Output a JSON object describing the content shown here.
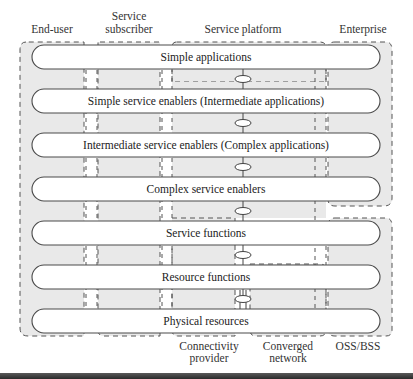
{
  "diagram": {
    "columns": [
      {
        "id": "end-user",
        "label_lines": [
          "End-user"
        ]
      },
      {
        "id": "service-subscriber",
        "label_lines": [
          "Service",
          "subscriber"
        ]
      },
      {
        "id": "service-platform",
        "label_lines": [
          "Service platform"
        ]
      },
      {
        "id": "enterprise",
        "label_lines": [
          "Enterprise"
        ]
      }
    ],
    "bottom_labels": [
      {
        "id": "connectivity-provider",
        "label_lines": [
          "Connectivity",
          "provider"
        ]
      },
      {
        "id": "converged-network",
        "label_lines": [
          "Converged",
          "network"
        ]
      },
      {
        "id": "oss-bss",
        "label_lines": [
          "OSS/BSS"
        ]
      }
    ],
    "layers": [
      "Simple applications",
      "Simple service enablers (Intermediate applications)",
      "Intermediate service enablers (Complex applications)",
      "Complex service enablers",
      "Service functions",
      "Resource functions",
      "Physical resources"
    ],
    "colors": {
      "region_fill": "#e9e9e9",
      "bar_fill": "#ffffff",
      "stroke": "#4a4a4a"
    }
  }
}
